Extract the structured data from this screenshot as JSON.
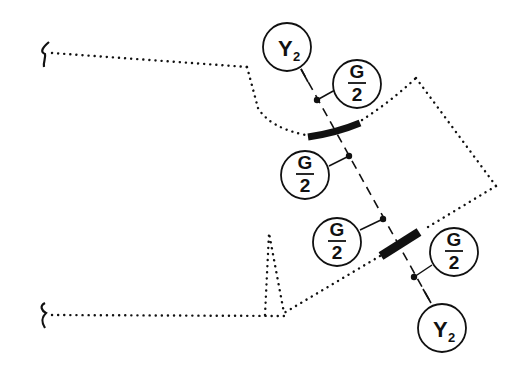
{
  "diagram": {
    "colors": {
      "ink": "#111111",
      "background": "#ffffff"
    },
    "nodes": [
      {
        "id": "y2-top",
        "label_main": "Y",
        "label_sub": "2",
        "kind": "reaction"
      },
      {
        "id": "g2-top",
        "numerator": "G",
        "denominator": "2",
        "kind": "load"
      },
      {
        "id": "g2-mid-left",
        "numerator": "G",
        "denominator": "2",
        "kind": "load"
      },
      {
        "id": "g2-mid-lower",
        "numerator": "G",
        "denominator": "2",
        "kind": "load"
      },
      {
        "id": "g2-right",
        "numerator": "G",
        "denominator": "2",
        "kind": "load"
      },
      {
        "id": "y2-bottom",
        "label_main": "Y",
        "label_sub": "2",
        "kind": "reaction"
      }
    ],
    "break_symbols": [
      "top-left-break",
      "bottom-left-break"
    ],
    "supports": [
      "upper-curved-bar",
      "lower-straight-bar"
    ]
  }
}
